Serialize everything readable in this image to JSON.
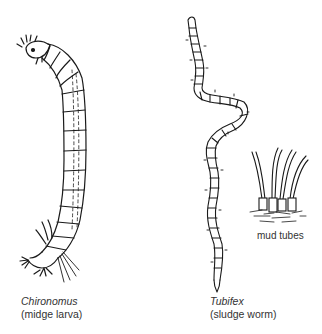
{
  "figure": {
    "organisms": [
      {
        "scientific_name": "Chironomus",
        "common_name": "(midge larva)"
      },
      {
        "scientific_name": "Tubifex",
        "common_name": "(sludge worm)"
      }
    ],
    "annotations": {
      "mud_tubes": "mud tubes"
    },
    "colors": {
      "ink": "#1a1a1a",
      "background": "#ffffff",
      "caption": "#333333"
    }
  }
}
